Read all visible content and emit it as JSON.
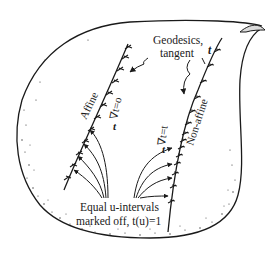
{
  "figure": {
    "type": "diagram",
    "colors": {
      "ink": "#1a1a1a",
      "background": "#ffffff"
    }
  },
  "labels": {
    "geodesics_line1": "Geodesics,",
    "geodesics_line2": "tangent",
    "tangent_symbol_top": "t",
    "affine": "Affine",
    "affine_eq": "∇t=o",
    "affine_t": "t",
    "non_affine": "Non-affine",
    "non_affine_eq": "∇t=t",
    "non_affine_t": "t",
    "equal_line1": "Equal u-intervals",
    "equal_line2": "marked off, t(u)=1"
  },
  "curves": [
    {
      "name": "affine-geodesic",
      "label": "Affine",
      "equation": "∇t=o",
      "tick_spacing": "equal"
    },
    {
      "name": "non-affine-geodesic",
      "label": "Non-affine",
      "equation": "∇t=t",
      "tick_spacing": "unequal"
    }
  ]
}
